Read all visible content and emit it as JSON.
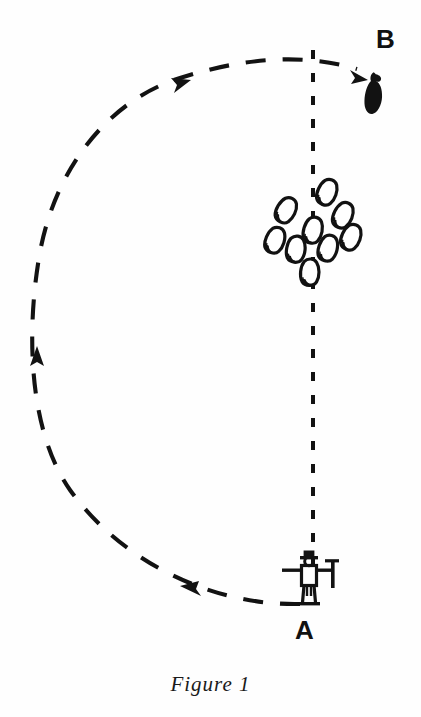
{
  "figure": {
    "caption": "Figure 1",
    "background_color": "#fefefe",
    "ink_color": "#111111",
    "width": 421,
    "height": 717,
    "labels": [
      {
        "id": "A",
        "text": "A",
        "x": 305,
        "y": 630,
        "meaning": "start-position-handler"
      },
      {
        "id": "B",
        "text": "B",
        "x": 388,
        "y": 40,
        "meaning": "end-position-dog"
      }
    ],
    "elements": {
      "handler": {
        "name": "shepherd-figure",
        "description": "stick figure with hat holding a crook, arms outstretched",
        "x": 310,
        "y": 580
      },
      "dog": {
        "name": "sheepdog-silhouette",
        "description": "solid black dog silhouette at point B",
        "x": 372,
        "y": 92
      },
      "flock": {
        "name": "sheep-flock",
        "count": 11,
        "description": "outlined oval sheep shapes scattered about the centre line",
        "sheep": [
          {
            "x": 326,
            "y": 192,
            "rot": 25
          },
          {
            "x": 287,
            "y": 212,
            "rot": 30
          },
          {
            "x": 341,
            "y": 217,
            "rot": 25
          },
          {
            "x": 313,
            "y": 230,
            "rot": 15
          },
          {
            "x": 350,
            "y": 237,
            "rot": 25
          },
          {
            "x": 276,
            "y": 240,
            "rot": 22
          },
          {
            "x": 296,
            "y": 248,
            "rot": 10
          },
          {
            "x": 327,
            "y": 247,
            "rot": 18
          },
          {
            "x": 310,
            "y": 272,
            "rot": 5
          }
        ]
      },
      "centre_line": {
        "name": "centre-line",
        "style": "dashed",
        "x": 313,
        "y_top": 50,
        "y_bottom": 565
      },
      "outrun_path": {
        "name": "outrun-path",
        "style": "dashed-arc",
        "direction": "counter-clockwise from A to B",
        "arrows": [
          {
            "x": 188,
            "y": 589,
            "dir": "left"
          },
          {
            "x": 37,
            "y": 358,
            "dir": "up"
          },
          {
            "x": 178,
            "y": 83,
            "dir": "right"
          },
          {
            "x": 360,
            "y": 76,
            "dir": "down-right"
          }
        ]
      }
    }
  }
}
